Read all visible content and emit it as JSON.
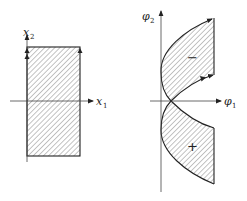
{
  "left_diagram": {
    "x_axis_label": "x",
    "x_axis_subscript": "1",
    "y_axis_label": "x",
    "y_axis_subscript": "2",
    "region": "rectangle",
    "hatch": "diagonal"
  },
  "right_diagram": {
    "x_axis_label": "φ",
    "x_axis_subscript": "1",
    "y_axis_label": "φ",
    "y_axis_subscript": "2",
    "upper_region_sign": "−",
    "lower_region_sign": "+",
    "hatch": "diagonal"
  },
  "colors": {
    "line": "#222222",
    "hatch": "#555555",
    "background": "#ffffff"
  }
}
